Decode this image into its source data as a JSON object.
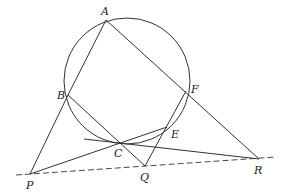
{
  "figure": {
    "colors": {
      "stroke": "#333333",
      "background": "#ffffff"
    },
    "circle": {
      "cx": 127,
      "cy": 81,
      "r": 63
    },
    "points": {
      "A": {
        "label": "A",
        "x": 106,
        "y": 20,
        "lx": 101,
        "ly": 15
      },
      "B": {
        "label": "B",
        "x": 68,
        "y": 95,
        "lx": 57,
        "ly": 99
      },
      "C": {
        "label": "C",
        "x": 119,
        "y": 143,
        "lx": 114,
        "ly": 157
      },
      "E": {
        "label": "E",
        "x": 167,
        "y": 127,
        "lx": 171,
        "ly": 138
      },
      "F": {
        "label": "F",
        "x": 186,
        "y": 91,
        "lx": 191,
        "ly": 93
      },
      "P": {
        "label": "P",
        "x": 30,
        "y": 174,
        "lx": 26,
        "ly": 189
      },
      "Q": {
        "label": "Q",
        "x": 145,
        "y": 166,
        "lx": 140,
        "ly": 181
      },
      "R": {
        "label": "R",
        "x": 259,
        "y": 159,
        "lx": 254,
        "ly": 174
      }
    },
    "segments": [
      {
        "from": "A",
        "to": "B"
      },
      {
        "from": "B",
        "to": "P"
      },
      {
        "from": "A",
        "to": "R"
      },
      {
        "from": "B",
        "to": "Q"
      },
      {
        "from": "P",
        "to": "E"
      },
      {
        "from": "F",
        "to": "Q"
      },
      {
        "x1": 84,
        "y1": 139,
        "to": "R"
      }
    ],
    "dashed_line": {
      "x1": 16,
      "y1": 175,
      "x2": 276,
      "y2": 157
    }
  }
}
